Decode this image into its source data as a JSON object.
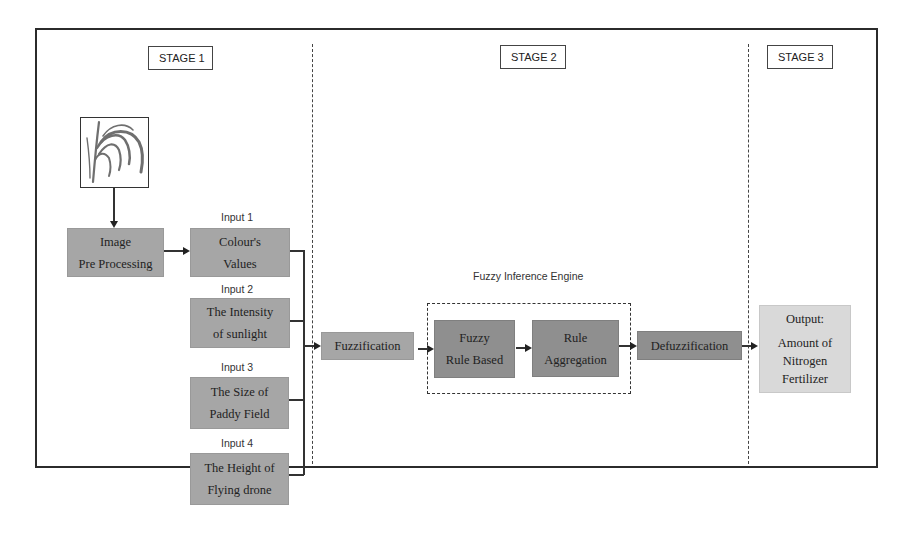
{
  "stages": [
    {
      "label": "STAGE 1"
    },
    {
      "label": "STAGE 2"
    },
    {
      "label": "STAGE 3"
    }
  ],
  "stage1": {
    "image_icon": "paddy-rice-plant-image",
    "preprocess": {
      "line1": "Image",
      "line2": "Pre Processing"
    },
    "inputs": [
      {
        "label": "Input 1",
        "line1": "Colour's",
        "line2": "Values"
      },
      {
        "label": "Input 2",
        "line1": "The Intensity",
        "line2": "of sunlight"
      },
      {
        "label": "Input 3",
        "line1": "The Size of",
        "line2": "Paddy Field"
      },
      {
        "label": "Input 4",
        "line1": "The Height of",
        "line2": "Flying drone"
      }
    ]
  },
  "stage2": {
    "fuzzification": "Fuzzification",
    "engine_label": "Fuzzy Inference Engine",
    "rule_based": {
      "line1": "Fuzzy",
      "line2": "Rule Based"
    },
    "aggregation": {
      "line1": "Rule",
      "line2": "Aggregation"
    },
    "defuzzification": "Defuzzification"
  },
  "stage3": {
    "output": {
      "title": "Output:",
      "line1": "Amount of",
      "line2": "Nitrogen",
      "line3": "Fertilizer"
    }
  },
  "colors": {
    "box_mid": "#a6a6a6",
    "box_dark": "#8f8f8f",
    "box_light": "#d9d9d9",
    "line": "#333333"
  }
}
